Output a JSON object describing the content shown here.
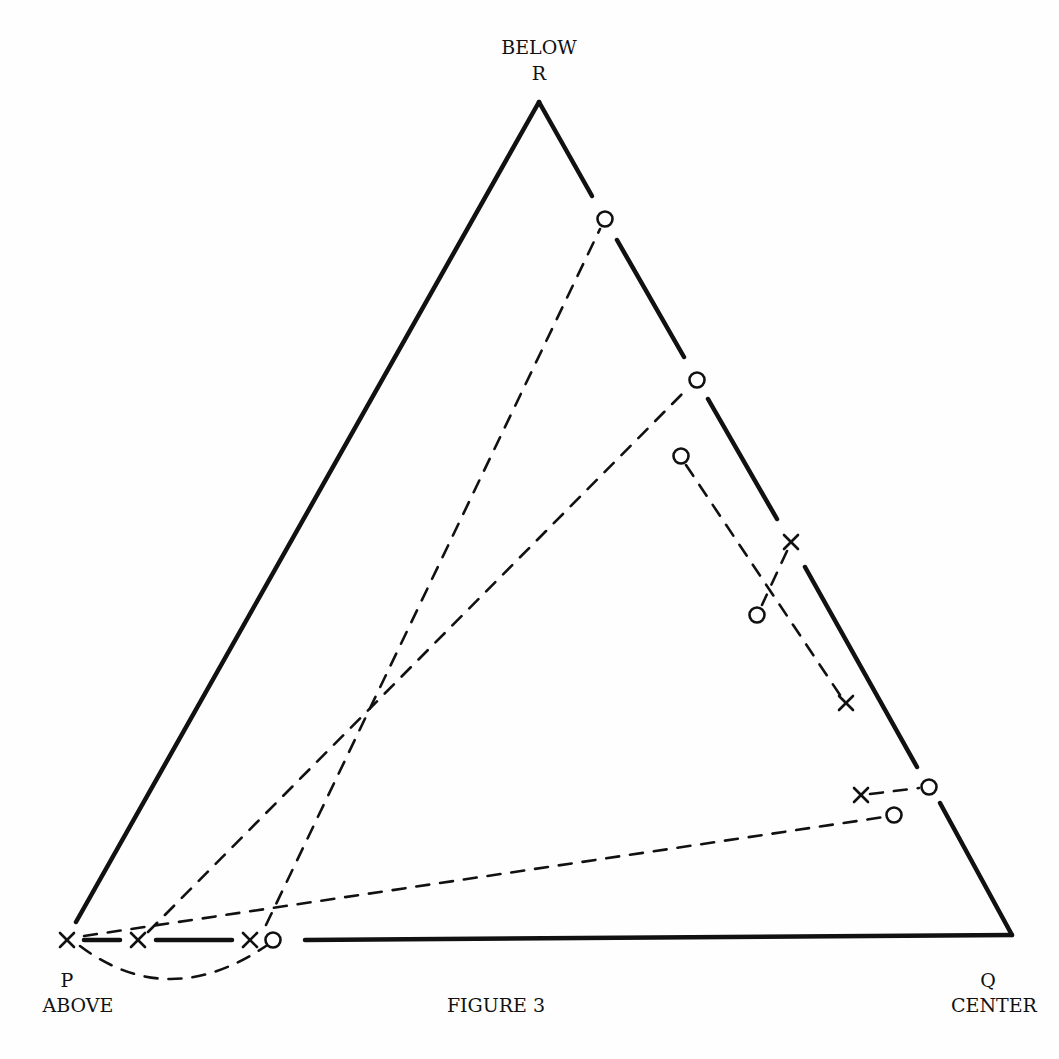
{
  "figure": {
    "caption": "FIGURE 3",
    "colors": {
      "ink": "#111111",
      "background": "#fefefe"
    }
  },
  "vertices": {
    "R": {
      "letter": "R",
      "name": "BELOW",
      "x": 539,
      "y": 102
    },
    "P": {
      "letter": "P",
      "name": "ABOVE",
      "x": 67,
      "y": 940
    },
    "Q": {
      "letter": "Q",
      "name": "CENTER",
      "x": 1012,
      "y": 935
    }
  },
  "edges": [
    {
      "id": "left-edge",
      "segments": [
        [
          539,
          102,
          76,
          922
        ]
      ]
    },
    {
      "id": "right-edge",
      "segments": [
        [
          539,
          102,
          592,
          196
        ],
        [
          617,
          240,
          684,
          357
        ],
        [
          708,
          399,
          777,
          519
        ],
        [
          805,
          567,
          917,
          767
        ],
        [
          940,
          803,
          1012,
          935
        ]
      ]
    },
    {
      "id": "bottom-edge",
      "segments": [
        [
          84,
          940,
          120,
          940
        ],
        [
          156,
          940,
          232,
          940
        ],
        [
          305,
          940,
          1012,
          935
        ]
      ]
    }
  ],
  "markers": [
    {
      "type": "circle",
      "x": 605,
      "y": 219
    },
    {
      "type": "circle",
      "x": 697,
      "y": 380
    },
    {
      "type": "circle",
      "x": 681,
      "y": 456
    },
    {
      "type": "cross",
      "x": 791,
      "y": 542
    },
    {
      "type": "circle",
      "x": 757,
      "y": 615
    },
    {
      "type": "cross",
      "x": 846,
      "y": 703
    },
    {
      "type": "cross",
      "x": 861,
      "y": 795
    },
    {
      "type": "circle",
      "x": 929,
      "y": 787
    },
    {
      "type": "circle",
      "x": 894,
      "y": 815
    },
    {
      "type": "cross",
      "x": 67,
      "y": 940
    },
    {
      "type": "cross",
      "x": 138,
      "y": 940
    },
    {
      "type": "cross",
      "x": 250,
      "y": 940
    },
    {
      "type": "circle",
      "x": 273,
      "y": 940
    }
  ],
  "dashed_lines": [
    {
      "from": [
        266,
        925
      ],
      "to": [
        600,
        229
      ]
    },
    {
      "from": [
        148,
        932
      ],
      "to": [
        689,
        387
      ]
    },
    {
      "from": [
        84,
        936
      ],
      "to": [
        884,
        817
      ]
    },
    {
      "from": [
        686,
        465
      ],
      "to": [
        840,
        695
      ]
    },
    {
      "from": [
        787,
        551
      ],
      "to": [
        762,
        605
      ]
    },
    {
      "from": [
        870,
        794
      ],
      "to": [
        919,
        788
      ]
    }
  ],
  "dashed_curves": [
    {
      "path": "M 80 946 Q 168 1012 266 946"
    }
  ]
}
